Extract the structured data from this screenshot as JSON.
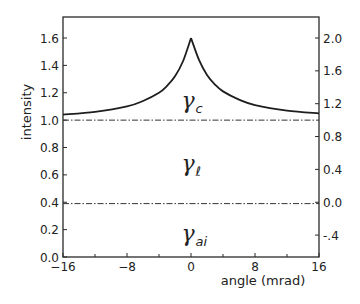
{
  "chart_data": {
    "type": "line",
    "title": "",
    "xlabel": "angle (mrad)",
    "ylabel": "intensity",
    "xlim": [
      -16,
      16
    ],
    "ylim": [
      0.0,
      1.75
    ],
    "x_ticks": [
      -16,
      -8,
      0,
      8,
      16
    ],
    "x_tick_labels": [
      "−16",
      "−8",
      "0",
      "8",
      "16"
    ],
    "x_minor_ticks": [
      -12,
      -4,
      4,
      12
    ],
    "y_left_ticks": [
      0.0,
      0.2,
      0.4,
      0.6,
      0.8,
      1.0,
      1.2,
      1.4,
      1.6
    ],
    "y_left_tick_labels": [
      "0.0",
      "0.2",
      "0.4",
      "0.6",
      "0.8",
      "1.0",
      "1.2",
      "1.4",
      "1.6"
    ],
    "y_right_ticks": [
      -0.4,
      0.0,
      0.4,
      0.8,
      1.2,
      1.6,
      2.0
    ],
    "y_right_tick_labels": [
      "-.4",
      "0.0",
      "0.4",
      "0.8",
      "1.2",
      "1.6",
      "2.0"
    ],
    "y_right_mapping": "right = (left - 0.4) / 0.6",
    "grid": false,
    "series": [
      {
        "name": "intensity curve",
        "style": "solid",
        "x": [
          -16,
          -12,
          -8,
          -6,
          -4,
          -3,
          -2,
          -1,
          0,
          1,
          2,
          3,
          4,
          6,
          8,
          12,
          16
        ],
        "values": [
          1.04,
          1.06,
          1.1,
          1.14,
          1.2,
          1.25,
          1.32,
          1.43,
          1.6,
          1.44,
          1.33,
          1.26,
          1.21,
          1.15,
          1.11,
          1.07,
          1.05
        ]
      },
      {
        "name": "reference line at 1.0",
        "style": "dash-dot",
        "x": [
          -16,
          16
        ],
        "values": [
          1.0,
          1.0
        ]
      },
      {
        "name": "reference line at 0.4",
        "style": "dash-dot",
        "x": [
          -16,
          16
        ],
        "values": [
          0.39,
          0.39
        ]
      }
    ],
    "annotations": [
      {
        "text": "γ",
        "subscript": "c",
        "x": -1.2,
        "y": 1.14
      },
      {
        "text": "γ",
        "subscript": "ℓ",
        "x": -1.2,
        "y": 0.68
      },
      {
        "text": "γ",
        "subscript": "ai",
        "x": -1.2,
        "y": 0.17
      }
    ]
  },
  "labels": {
    "xlabel": "angle (mrad)",
    "ylabel": "intensity",
    "gamma": "γ",
    "sub_c": "c",
    "sub_l": "ℓ",
    "sub_ai": "ai"
  }
}
